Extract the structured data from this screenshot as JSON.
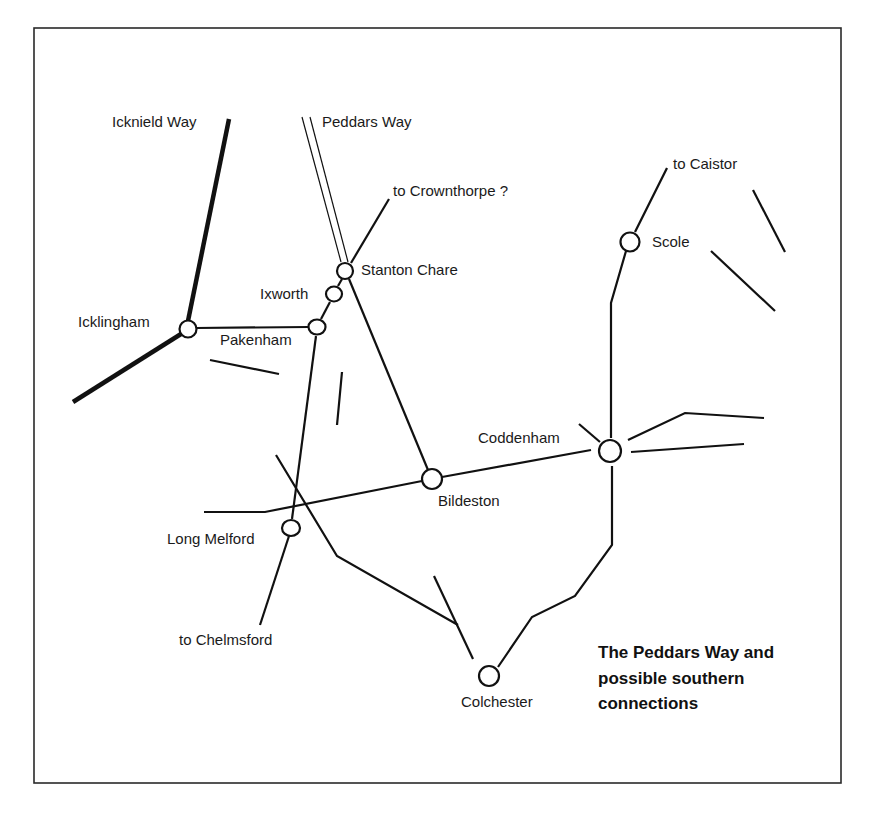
{
  "map": {
    "title_lines": [
      "The Peddars Way and",
      "possible southern",
      "connections"
    ],
    "routes": {
      "icknield_way": "Icknield Way",
      "peddars_way": "Peddars Way",
      "to_crownthorpe": "to Crownthorpe ?",
      "to_caistor": "to Caistor",
      "to_chelmsford": "to Chelmsford"
    },
    "towns": {
      "icklingham": "Icklingham",
      "pakenham": "Pakenham",
      "ixworth": "Ixworth",
      "stanton_chare": "Stanton Chare",
      "scole": "Scole",
      "coddenham": "Coddenham",
      "bildeston": "Bildeston",
      "long_melford": "Long Melford",
      "colchester": "Colchester"
    },
    "colors": {
      "ink": "#111111",
      "background": "#ffffff",
      "frame": "#2a2a2a"
    }
  }
}
